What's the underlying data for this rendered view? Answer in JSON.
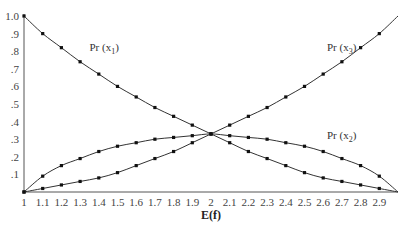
{
  "chart_data": {
    "type": "line",
    "title": "",
    "xlabel": "E(f)",
    "ylabel": "",
    "xlim": [
      1,
      3
    ],
    "ylim": [
      0,
      1
    ],
    "grid": false,
    "legend": "inline labels",
    "x_ticks": [
      "1",
      "1.1",
      "1.2",
      "1.3",
      "1.4",
      "1.5",
      "1.6",
      "1.7",
      "1.8",
      "1.9",
      "2",
      "2.1",
      "2.2",
      "2.3",
      "2.4",
      "2.5",
      "2.6",
      "2.7",
      "2.8",
      "2.9"
    ],
    "y_ticks": [
      ".1",
      ".2",
      ".3",
      ".4",
      ".5",
      ".6",
      ".7",
      ".8",
      ".9",
      "1.0"
    ],
    "x": [
      1.0,
      1.1,
      1.2,
      1.3,
      1.4,
      1.5,
      1.6,
      1.7,
      1.8,
      1.9,
      2.0,
      2.1,
      2.2,
      2.3,
      2.4,
      2.5,
      2.6,
      2.7,
      2.8,
      2.9,
      3.0
    ],
    "series": [
      {
        "name": "Pr (x1)",
        "label_main": "Pr (x",
        "label_sub": "1",
        "values": [
          1.0,
          0.9,
          0.82,
          0.74,
          0.67,
          0.6,
          0.54,
          0.48,
          0.43,
          0.38,
          0.33,
          0.28,
          0.23,
          0.19,
          0.15,
          0.11,
          0.08,
          0.06,
          0.04,
          0.02,
          0.0
        ]
      },
      {
        "name": "Pr (x2)",
        "label_main": "Pr (x",
        "label_sub": "2",
        "values": [
          0.0,
          0.09,
          0.15,
          0.19,
          0.23,
          0.26,
          0.28,
          0.3,
          0.31,
          0.32,
          0.33,
          0.32,
          0.31,
          0.3,
          0.28,
          0.26,
          0.23,
          0.19,
          0.15,
          0.09,
          0.0
        ]
      },
      {
        "name": "Pr (x3)",
        "label_main": "Pr (x",
        "label_sub": "3",
        "values": [
          0.0,
          0.02,
          0.04,
          0.06,
          0.08,
          0.11,
          0.15,
          0.19,
          0.23,
          0.28,
          0.33,
          0.38,
          0.43,
          0.48,
          0.54,
          0.6,
          0.67,
          0.74,
          0.82,
          0.9,
          1.0
        ]
      }
    ],
    "label_positions": [
      {
        "series": 0,
        "x": 1.35,
        "y": 0.8
      },
      {
        "series": 1,
        "x": 2.62,
        "y": 0.3
      },
      {
        "series": 2,
        "x": 2.62,
        "y": 0.8
      }
    ]
  }
}
